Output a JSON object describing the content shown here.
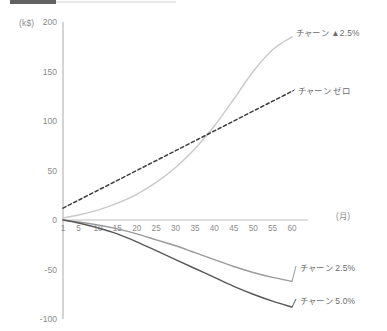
{
  "chart_data": {
    "type": "line",
    "title": "",
    "subtitle": "",
    "xlabel": "(月)",
    "ylabel": "(k$)",
    "xlim": [
      1,
      60
    ],
    "ylim": [
      -100,
      200
    ],
    "grid": false,
    "legend_position": "inline-right-of-line-ends",
    "x_ticks": [
      "1",
      "5",
      "10",
      "15",
      "20",
      "25",
      "30",
      "35",
      "40",
      "45",
      "50",
      "55",
      "60"
    ],
    "x_tick_values": [
      1,
      5,
      10,
      15,
      20,
      25,
      30,
      35,
      40,
      45,
      50,
      55,
      60
    ],
    "y_ticks": [
      "200",
      "150",
      "100",
      "50",
      "0",
      "-50",
      "-100"
    ],
    "y_tick_values": [
      200,
      150,
      100,
      50,
      0,
      -50,
      -100
    ],
    "x": [
      1,
      5,
      10,
      15,
      20,
      25,
      30,
      35,
      40,
      45,
      50,
      55,
      60
    ],
    "series": [
      {
        "name": "チャーン ▲2.5%",
        "color": "#c9c9c9",
        "style": "solid",
        "values": [
          2,
          5,
          10,
          17,
          26,
          38,
          53,
          72,
          95,
          122,
          150,
          172,
          185
        ]
      },
      {
        "name": "チャーン ゼロ",
        "color": "#3d3d3d",
        "style": "dashed",
        "values": [
          12,
          20,
          30,
          40,
          50,
          60,
          70,
          80,
          90,
          100,
          110,
          120,
          130
        ]
      },
      {
        "name": "チャーン 2.5%",
        "color": "#9a9a9a",
        "style": "solid",
        "values": [
          0,
          -2,
          -5,
          -9,
          -14,
          -20,
          -26,
          -33,
          -40,
          -47,
          -53,
          -58,
          -62
        ]
      },
      {
        "name": "チャーン 5.0%",
        "color": "#585858",
        "style": "solid",
        "values": [
          0,
          -3,
          -8,
          -14,
          -22,
          -31,
          -40,
          -49,
          -58,
          -67,
          -75,
          -82,
          -88
        ]
      }
    ]
  },
  "axis": {
    "y_unit_label": "(k$)",
    "x_unit_label": "(月)"
  },
  "series_labels": [
    {
      "text": "チャーン ▲2.5%",
      "name": "series-label-churn-up-2-5"
    },
    {
      "text": "チャーン ゼロ",
      "name": "series-label-churn-zero"
    },
    {
      "text": "チャーン 2.5%",
      "name": "series-label-churn-2-5"
    },
    {
      "text": "チャーン 5.0%",
      "name": "series-label-churn-5-0"
    }
  ],
  "y_tick_labels": [
    "200",
    "150",
    "100",
    "50",
    "0",
    "-50",
    "-100"
  ],
  "x_tick_labels": [
    "1",
    "5",
    "10",
    "15",
    "20",
    "25",
    "30",
    "35",
    "40",
    "45",
    "50",
    "55",
    "60"
  ]
}
